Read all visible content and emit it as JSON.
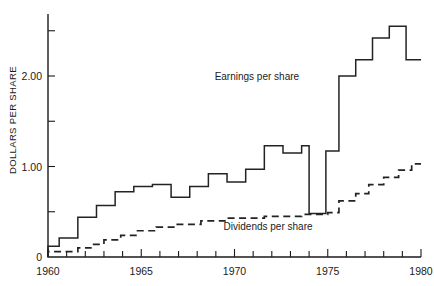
{
  "chart_data": {
    "type": "line",
    "title": "",
    "subtitle": "",
    "xlabel": "",
    "ylabel": "DOLLARS PER SHARE",
    "xlim": [
      1960,
      1980
    ],
    "ylim": [
      0,
      2.75
    ],
    "grid": false,
    "legend_position": "inline-annotations",
    "step_style": "post",
    "x_major_ticks": [
      1960,
      1965,
      1970,
      1975,
      1980
    ],
    "x_major_tick_labels": [
      "1960",
      "1965",
      "1970",
      "1975",
      "1980"
    ],
    "x_minor_ticks": [
      1961,
      1962,
      1963,
      1964,
      1966,
      1967,
      1968,
      1969,
      1971,
      1972,
      1973,
      1974,
      1976,
      1977,
      1978,
      1979
    ],
    "y_major_ticks": [
      0,
      1.0,
      2.0
    ],
    "y_major_tick_labels": [
      "0",
      "1.00",
      "2.00"
    ],
    "y_minor_ticks": [
      0.5,
      1.5,
      2.5
    ],
    "x": [
      1960,
      1961,
      1962,
      1963,
      1964,
      1965,
      1966,
      1967,
      1968,
      1969,
      1970,
      1971,
      1972,
      1973,
      1974,
      1975,
      1976,
      1977,
      1978,
      1979,
      1980
    ],
    "series": [
      {
        "name": "Earnings per share",
        "style": "solid",
        "annotation": "Earnings per share",
        "values": [
          0.12,
          0.21,
          0.21,
          0.44,
          0.57,
          0.72,
          0.78,
          0.8,
          0.66,
          0.66,
          0.78,
          1.02,
          1.02,
          0.92,
          1.23,
          1.23,
          1.05,
          0.48,
          0.48,
          1.17,
          1.17
        ]
      },
      {
        "name": "Dividends per share",
        "style": "dashed",
        "annotation": "Dividends per share",
        "values": [
          0.06,
          0.06,
          0.1,
          0.14,
          0.19,
          0.22,
          0.26,
          0.3,
          0.3,
          0.33,
          0.36,
          0.38,
          0.4,
          0.41,
          0.42,
          0.44,
          0.46,
          0.47,
          0.47,
          0.56,
          0.64
        ]
      }
    ],
    "earnings_steps": [
      {
        "year": 1960.0,
        "value": 0.12
      },
      {
        "year": 1960.6,
        "value": 0.21
      },
      {
        "year": 1961.6,
        "value": 0.44
      },
      {
        "year": 1962.6,
        "value": 0.57
      },
      {
        "year": 1963.6,
        "value": 0.72
      },
      {
        "year": 1964.6,
        "value": 0.78
      },
      {
        "year": 1965.6,
        "value": 0.8
      },
      {
        "year": 1966.6,
        "value": 0.66
      },
      {
        "year": 1967.6,
        "value": 0.78
      },
      {
        "year": 1968.6,
        "value": 0.92
      },
      {
        "year": 1969.6,
        "value": 0.83
      },
      {
        "year": 1970.6,
        "value": 0.97
      },
      {
        "year": 1971.6,
        "value": 1.23
      },
      {
        "year": 1972.6,
        "value": 1.15
      },
      {
        "year": 1973.6,
        "value": 1.23
      },
      {
        "year": 1974.0,
        "value": 0.48
      },
      {
        "year": 1974.9,
        "value": 1.17
      },
      {
        "year": 1975.6,
        "value": 2.0
      },
      {
        "year": 1976.5,
        "value": 2.18
      },
      {
        "year": 1977.4,
        "value": 2.42
      },
      {
        "year": 1978.3,
        "value": 2.55
      },
      {
        "year": 1979.2,
        "value": 2.18
      },
      {
        "year": 1980.0,
        "value": 2.18
      }
    ],
    "dividends_steps": [
      {
        "year": 1960.0,
        "value": 0.06
      },
      {
        "year": 1961.6,
        "value": 0.1
      },
      {
        "year": 1962.3,
        "value": 0.14
      },
      {
        "year": 1963.0,
        "value": 0.19
      },
      {
        "year": 1963.9,
        "value": 0.24
      },
      {
        "year": 1964.8,
        "value": 0.29
      },
      {
        "year": 1965.8,
        "value": 0.33
      },
      {
        "year": 1966.8,
        "value": 0.36
      },
      {
        "year": 1968.2,
        "value": 0.4
      },
      {
        "year": 1969.6,
        "value": 0.43
      },
      {
        "year": 1971.6,
        "value": 0.45
      },
      {
        "year": 1973.6,
        "value": 0.47
      },
      {
        "year": 1975.0,
        "value": 0.49
      },
      {
        "year": 1975.6,
        "value": 0.62
      },
      {
        "year": 1976.5,
        "value": 0.7
      },
      {
        "year": 1977.2,
        "value": 0.8
      },
      {
        "year": 1978.0,
        "value": 0.88
      },
      {
        "year": 1978.8,
        "value": 0.96
      },
      {
        "year": 1979.5,
        "value": 1.03
      },
      {
        "year": 1980.0,
        "value": 1.03
      }
    ],
    "annotations": [
      {
        "name": "earnings-label",
        "text": "Earnings per share",
        "x": 1971.2,
        "y": 1.96
      },
      {
        "name": "dividends-label",
        "text": "Dividends per share",
        "x": 1971.8,
        "y": 0.3
      }
    ]
  }
}
